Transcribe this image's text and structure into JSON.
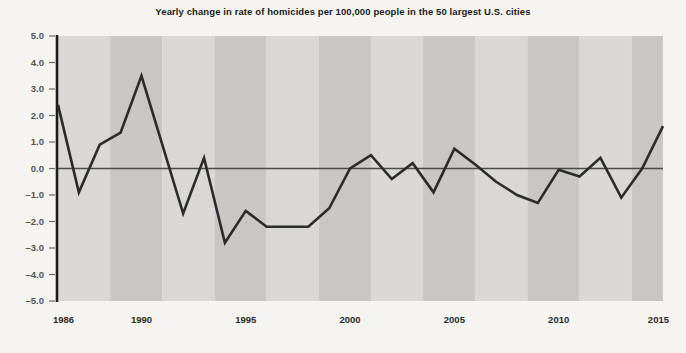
{
  "chart_data": {
    "type": "line",
    "title": "Yearly change in rate of homicides per 100,000 people in the 50 largest U.S. cities",
    "xlabel": "",
    "ylabel": "",
    "xlim": [
      1986,
      2015
    ],
    "ylim": [
      -5.0,
      5.0
    ],
    "grid": false,
    "legend": "none",
    "zero_line": 0.0,
    "x_tick_labels": [
      "1986",
      "1990",
      "1995",
      "2000",
      "2005",
      "2010",
      "2015"
    ],
    "x_tick_values": [
      1986,
      1990,
      1995,
      2000,
      2005,
      2010,
      2015
    ],
    "y_tick_labels": [
      "5.0",
      "4.0",
      "3.0",
      "2.0",
      "1.0",
      "0.0",
      "–1.0",
      "–2.0",
      "–3.0",
      "–4.0",
      "–5.0"
    ],
    "y_tick_values": [
      5,
      4,
      3,
      2,
      1,
      0,
      -1,
      -2,
      -3,
      -4,
      -5
    ],
    "x": [
      1986,
      1987,
      1988,
      1989,
      1990,
      1991,
      1992,
      1993,
      1994,
      1995,
      1996,
      1997,
      1998,
      1999,
      2000,
      2001,
      2002,
      2003,
      2004,
      2005,
      2006,
      2007,
      2008,
      2009,
      2010,
      2011,
      2012,
      2013,
      2014,
      2015
    ],
    "values": [
      2.4,
      -0.9,
      0.9,
      1.35,
      3.5,
      0.9,
      -1.7,
      0.4,
      -2.8,
      -1.6,
      -2.2,
      -2.2,
      -2.2,
      -1.5,
      0.0,
      0.5,
      -0.4,
      0.2,
      -0.9,
      0.75,
      0.15,
      -0.5,
      -1.0,
      -1.3,
      -0.05,
      -0.3,
      0.4,
      -1.1,
      0.0,
      1.6
    ],
    "series": [
      {
        "name": "Yearly change in homicide rate",
        "color": "#2b2b2b",
        "values": [
          2.4,
          -0.9,
          0.9,
          1.35,
          3.5,
          0.9,
          -1.7,
          0.4,
          -2.8,
          -1.6,
          -2.2,
          -2.2,
          -2.2,
          -1.5,
          0.0,
          0.5,
          -0.4,
          0.2,
          -0.9,
          0.75,
          0.15,
          -0.5,
          -1.0,
          -1.3,
          -0.05,
          -0.3,
          0.4,
          -1.1,
          0.0,
          1.6
        ]
      }
    ],
    "style": {
      "background_color": "#f6f4f0",
      "band_light_color": "#d9d8d6",
      "band_dark_color": "#c8c7c4",
      "axis_color": "#1d1d1d",
      "zero_line_color": "#4a4a48",
      "line_color": "#2b2b2b",
      "line_width": 2.6,
      "band_period_years": 2.5
    }
  }
}
